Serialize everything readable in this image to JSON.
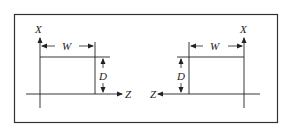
{
  "figure": {
    "left_panel": {
      "axis_x_label": "X",
      "axis_z_label": "Z",
      "width_label": "W",
      "depth_label": "D"
    },
    "right_panel": {
      "axis_x_label": "X",
      "axis_z_label": "Z",
      "width_label": "W",
      "depth_label": "D"
    },
    "colors": {
      "line": "#222222",
      "background": "#ffffff"
    }
  }
}
